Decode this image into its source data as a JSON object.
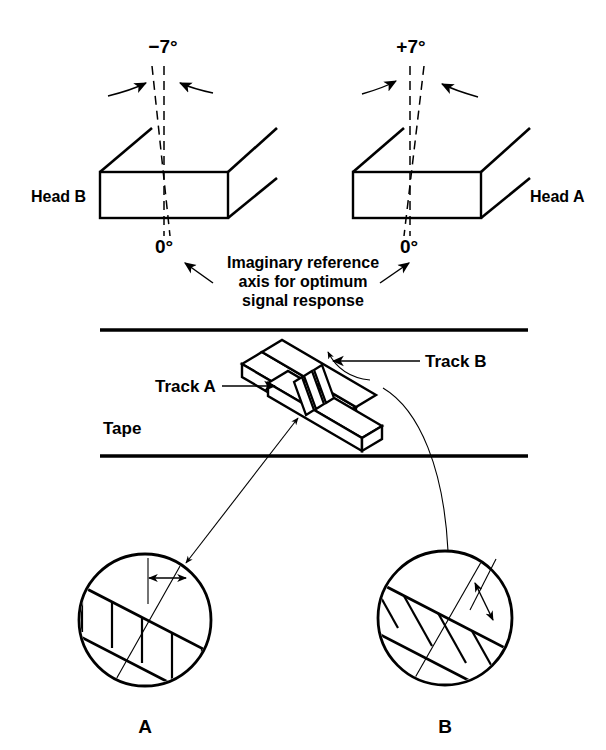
{
  "figure": {
    "ink_color": "#000000",
    "background_color": "#ffffff"
  },
  "top_panel": {
    "left_head": {
      "angle_label": "−7°",
      "zero_label": "0°",
      "head_label": "Head B",
      "tilt_degrees": -7
    },
    "right_head": {
      "angle_label": "+7°",
      "zero_label": "0°",
      "head_label": "Head A",
      "tilt_degrees": 7
    },
    "caption_lines": [
      "Imaginary reference",
      "axis for optimum",
      "signal response"
    ]
  },
  "middle_panel": {
    "tape_label": "Tape",
    "track_a_label": "Track A",
    "track_b_label": "Track B"
  },
  "bottom_panel": {
    "circle_a_label": "A",
    "circle_b_label": "B"
  }
}
